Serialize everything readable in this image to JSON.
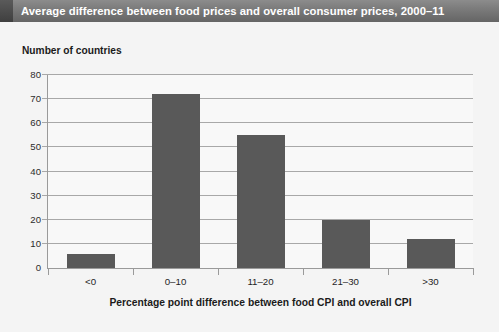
{
  "header": {
    "title": "Average difference between food prices and overall consumer prices, 2000–11"
  },
  "colors": {
    "title_bar_dark": "#3f3f3f",
    "title_bar_light": "#8c8c8c",
    "title_text": "#ffffff",
    "bar_fill": "#595959",
    "gridline": "#a8a8a8",
    "axis_line": "#9a9a9a",
    "plot_background": "#f8f8f8",
    "page_background": "#f4f4f4"
  },
  "chart_data": {
    "type": "bar",
    "title": "Average difference between food prices and overall consumer prices, 2000–11",
    "subtitle": "",
    "xlabel": "Percentage point difference between food CPI and overall CPI",
    "ylabel": "Number of countries",
    "categories": [
      "<0",
      "0–10",
      "11–20",
      "21–30",
      ">30"
    ],
    "values": [
      6,
      72,
      55,
      20,
      12
    ],
    "ylim": [
      0,
      80
    ],
    "yticks": [
      0,
      10,
      20,
      30,
      40,
      50,
      60,
      70,
      80
    ],
    "ytick_labels": [
      "0",
      "10",
      "20",
      "30",
      "40",
      "50",
      "60",
      "70",
      "80"
    ],
    "grid": true,
    "grid_axis": "y",
    "legend": false,
    "legend_position": "none",
    "series": [
      {
        "name": "Number of countries",
        "color": "#595959",
        "values": [
          6,
          72,
          55,
          20,
          12
        ]
      }
    ]
  }
}
